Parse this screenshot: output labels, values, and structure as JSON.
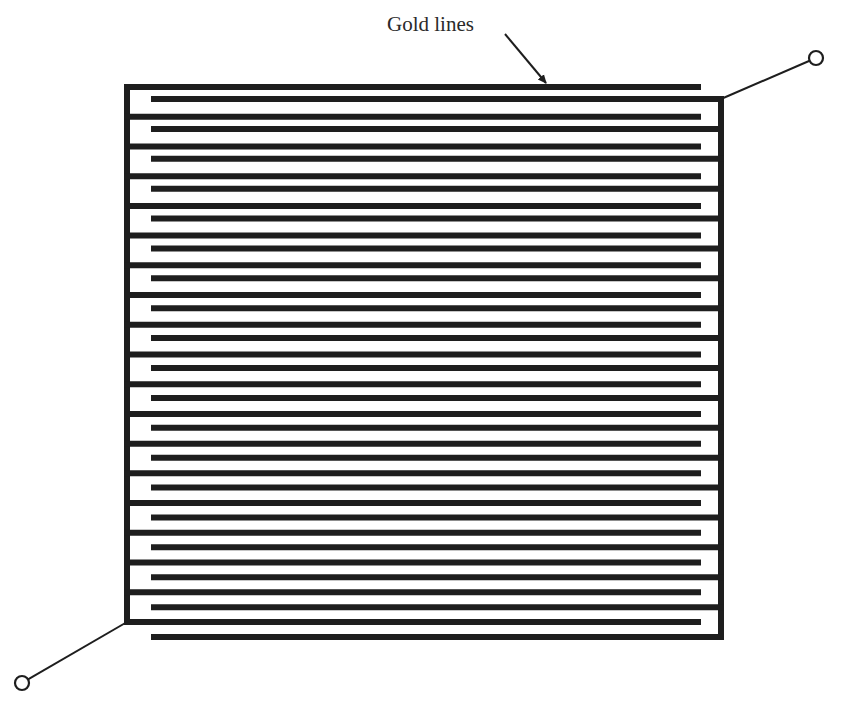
{
  "figure": {
    "type": "interdigitated electrode",
    "label": "Gold lines",
    "colors": {
      "line": "#1e1e1e",
      "background": "#ffffff"
    },
    "electrode_a": {
      "bus_x": 127,
      "bus_top": 87,
      "bus_bottom": 622,
      "finger_end_x": 701,
      "finger_count": 19,
      "first_finger_y": 87,
      "finger_pitch": 29.72
    },
    "electrode_b": {
      "bus_x": 721,
      "bus_top": 99,
      "bus_bottom": 637,
      "finger_start_x": 151,
      "finger_count": 19,
      "first_finger_y": 99,
      "finger_pitch": 29.89
    },
    "terminals": [
      {
        "name": "terminal-top-right",
        "cx": 816,
        "cy": 58,
        "r": 7,
        "lead_from": [
          721,
          99
        ]
      },
      {
        "name": "terminal-bottom-left",
        "cx": 22,
        "cy": 683,
        "r": 7,
        "lead_from": [
          127,
          622
        ]
      }
    ],
    "arrow": {
      "from": [
        505,
        34
      ],
      "to": [
        546,
        83
      ]
    },
    "label_pos": {
      "x": 387,
      "y": 31
    }
  }
}
